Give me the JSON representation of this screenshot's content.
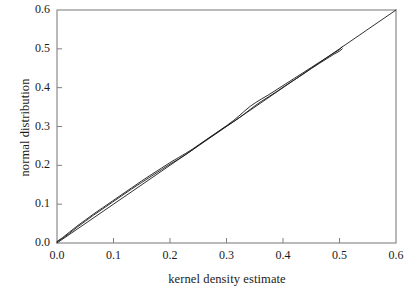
{
  "chart_data": {
    "type": "line",
    "title": "",
    "xlabel": "kernel density estimate",
    "ylabel": "normal distribution",
    "xlim": [
      0.0,
      0.6
    ],
    "ylim": [
      0.0,
      0.6
    ],
    "xticks": [
      "0.0",
      "0.1",
      "0.2",
      "0.3",
      "0.4",
      "0.5",
      "0.6"
    ],
    "yticks": [
      "0.0",
      "0.1",
      "0.2",
      "0.3",
      "0.4",
      "0.5",
      "0.6"
    ],
    "xtick_values": [
      0.0,
      0.1,
      0.2,
      0.3,
      0.4,
      0.5,
      0.6
    ],
    "ytick_values": [
      0.0,
      0.1,
      0.2,
      0.3,
      0.4,
      0.5,
      0.6
    ],
    "grid": false,
    "legend": false,
    "legend_position": "none",
    "line_color": "#1a1a1a",
    "frame_color": "#808080",
    "background": "#ffffff",
    "series": [
      {
        "name": "reference line",
        "style": "straight diagonal identity line",
        "x": [
          0.0,
          0.6
        ],
        "values": [
          0.0,
          0.6
        ]
      },
      {
        "name": "qq curve a",
        "style": "quantile-quantile trace",
        "x": [
          0.0,
          0.01,
          0.022,
          0.035,
          0.05,
          0.065,
          0.08,
          0.098,
          0.115,
          0.132,
          0.15,
          0.168,
          0.185,
          0.2,
          0.215,
          0.228,
          0.24,
          0.252,
          0.265,
          0.278,
          0.29,
          0.3,
          0.312,
          0.322,
          0.332,
          0.342,
          0.352,
          0.362,
          0.375,
          0.39,
          0.405,
          0.42,
          0.435,
          0.45,
          0.465,
          0.478,
          0.49,
          0.5,
          0.505
        ],
        "values": [
          0.004,
          0.014,
          0.028,
          0.043,
          0.059,
          0.075,
          0.09,
          0.108,
          0.125,
          0.142,
          0.16,
          0.177,
          0.193,
          0.207,
          0.22,
          0.231,
          0.242,
          0.254,
          0.267,
          0.28,
          0.292,
          0.302,
          0.315,
          0.327,
          0.34,
          0.352,
          0.362,
          0.371,
          0.382,
          0.396,
          0.41,
          0.424,
          0.438,
          0.452,
          0.466,
          0.478,
          0.489,
          0.498,
          0.506
        ]
      },
      {
        "name": "qq curve b",
        "style": "quantile-quantile trace overlapping",
        "x": [
          0.0,
          0.01,
          0.022,
          0.035,
          0.05,
          0.065,
          0.08,
          0.098,
          0.115,
          0.132,
          0.15,
          0.168,
          0.185,
          0.2,
          0.215,
          0.228,
          0.24,
          0.252,
          0.265,
          0.278,
          0.29,
          0.3,
          0.312,
          0.322,
          0.332,
          0.342,
          0.352,
          0.362,
          0.375,
          0.39,
          0.405,
          0.42,
          0.435,
          0.45,
          0.465,
          0.478,
          0.49,
          0.5,
          0.505
        ],
        "values": [
          0.003,
          0.012,
          0.025,
          0.04,
          0.056,
          0.072,
          0.087,
          0.105,
          0.122,
          0.139,
          0.156,
          0.173,
          0.189,
          0.203,
          0.216,
          0.228,
          0.24,
          0.253,
          0.266,
          0.279,
          0.291,
          0.301,
          0.312,
          0.322,
          0.333,
          0.344,
          0.355,
          0.365,
          0.377,
          0.391,
          0.406,
          0.42,
          0.434,
          0.449,
          0.463,
          0.475,
          0.486,
          0.494,
          0.5
        ]
      }
    ]
  }
}
